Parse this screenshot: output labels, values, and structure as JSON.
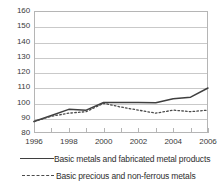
{
  "chart_data": {
    "type": "line",
    "title": "",
    "subtitle": "",
    "xlabel": "",
    "ylabel": "",
    "xlim": [
      1996,
      2006
    ],
    "ylim": [
      80,
      160
    ],
    "ytick_step": 10,
    "grid": true,
    "legend_position": "bottom",
    "yticks": [
      160,
      150,
      140,
      130,
      120,
      110,
      100,
      90,
      80
    ],
    "xticks": [
      1996,
      1998,
      2000,
      2002,
      2004,
      2006
    ],
    "xticks_all": [
      1996,
      1997,
      1998,
      1999,
      2000,
      2001,
      2002,
      2003,
      2004,
      2005,
      2006
    ],
    "x": [
      1996,
      1997,
      1998,
      1999,
      2000,
      2001,
      2002,
      2003,
      2004,
      2005,
      2006
    ],
    "series": [
      {
        "name": "Basic metals and fabricated metal products",
        "style": "solid",
        "color": "#3f3f3f",
        "values": [
          87.5,
          91.5,
          95.5,
          95.0,
          100.0,
          100.0,
          100.0,
          99.8,
          102.5,
          103.5,
          109.5
        ]
      },
      {
        "name": "Basic precious and non-ferrous metals",
        "style": "dashed",
        "color": "#4a4a4a",
        "values": [
          87.5,
          91.0,
          93.0,
          94.0,
          99.5,
          97.0,
          95.0,
          93.0,
          95.0,
          94.0,
          95.0
        ]
      }
    ],
    "legend": [
      "Basic metals and fabricated metal products",
      "Basic precious and non-ferrous metals"
    ]
  }
}
